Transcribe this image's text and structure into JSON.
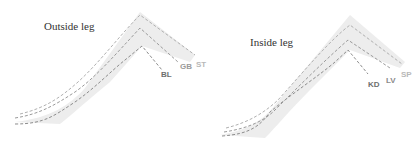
{
  "panels": [
    {
      "title": "Outside leg",
      "labels": [
        {
          "text": "BL",
          "color": "#6e6e6e"
        },
        {
          "text": "GB",
          "color": "#9a9a9a"
        },
        {
          "text": "ST",
          "color": "#b8b8b8"
        }
      ]
    },
    {
      "title": "Inside leg",
      "labels": [
        {
          "text": "KD",
          "color": "#6e6e6e"
        },
        {
          "text": "LV",
          "color": "#8a8a8a"
        },
        {
          "text": "SP",
          "color": "#b8b8b8"
        }
      ]
    }
  ],
  "colors": {
    "leg_fill": "#ededed",
    "dash": "#8c8c8c"
  }
}
